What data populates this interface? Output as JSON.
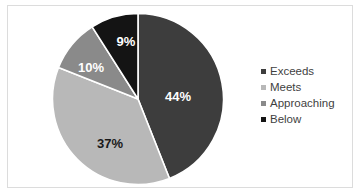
{
  "chart_data": {
    "type": "pie",
    "title": "",
    "subtitle": "",
    "xlabel": "",
    "ylabel": "",
    "grid": false,
    "legend_position": "right",
    "start_angle_deg": 0,
    "direction": "clockwise",
    "categories": [
      "Exceeds",
      "Meets",
      "Approaching",
      "Below"
    ],
    "values": [
      44,
      37,
      10,
      9
    ],
    "value_unit": "%",
    "data_labels": [
      "44%",
      "37%",
      "10%",
      "9%"
    ],
    "colors": [
      "#3d3d3d",
      "#b8b8b8",
      "#8a8a8a",
      "#141414"
    ],
    "label_text_colors": [
      "#ffffff",
      "#1a1a1a",
      "#ffffff",
      "#ffffff"
    ],
    "slices": [
      {
        "label": "Exceeds",
        "value": 44,
        "data_label": "44%",
        "color": "#3d3d3d",
        "label_color": "#ffffff",
        "label_x": 178,
        "label_y": 96
      },
      {
        "label": "Meets",
        "value": 37,
        "data_label": "37%",
        "color": "#b8b8b8",
        "label_color": "#1a1a1a",
        "label_x": 110,
        "label_y": 143
      },
      {
        "label": "Approaching",
        "value": 10,
        "data_label": "10%",
        "color": "#8a8a8a",
        "label_color": "#ffffff",
        "label_x": 91,
        "label_y": 67
      },
      {
        "label": "Below",
        "value": 9,
        "data_label": "9%",
        "color": "#141414",
        "label_color": "#ffffff",
        "label_x": 126,
        "label_y": 41
      }
    ]
  },
  "legend": {
    "items": [
      {
        "label": "Exceeds",
        "color": "#3d3d3d"
      },
      {
        "label": "Meets",
        "color": "#b8b8b8"
      },
      {
        "label": "Approaching",
        "color": "#8a8a8a"
      },
      {
        "label": "Below",
        "color": "#141414"
      }
    ]
  },
  "style": {
    "background": "#ffffff",
    "frame_border": "#dcdcdc",
    "slice_separator": "#ffffff",
    "legend_text": "#3f3f3f"
  }
}
